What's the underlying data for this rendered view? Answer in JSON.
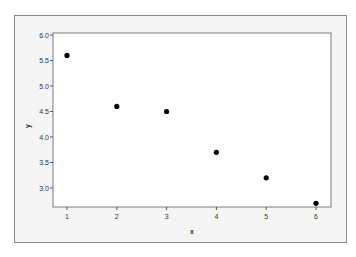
{
  "chart_data": {
    "type": "scatter",
    "title": "",
    "xlabel": "x",
    "ylabel": "y",
    "x": [
      1,
      2,
      3,
      4,
      5,
      6
    ],
    "y": [
      5.6,
      4.6,
      4.5,
      3.7,
      3.2,
      2.7
    ],
    "xticks": [
      "1",
      "2",
      "3",
      "4",
      "5",
      "6"
    ],
    "yticks": [
      "3.0",
      "3.5",
      "4.0",
      "4.5",
      "5.0",
      "5.5",
      "6.0"
    ],
    "xlim": [
      0.7,
      6.3
    ],
    "ylim": [
      2.65,
      6.0
    ],
    "grid": false,
    "legend": null,
    "marker_color": "#000000",
    "plot_background": "#ffffff",
    "frame_background": "#f5f5f5"
  },
  "title_fragment": "`"
}
